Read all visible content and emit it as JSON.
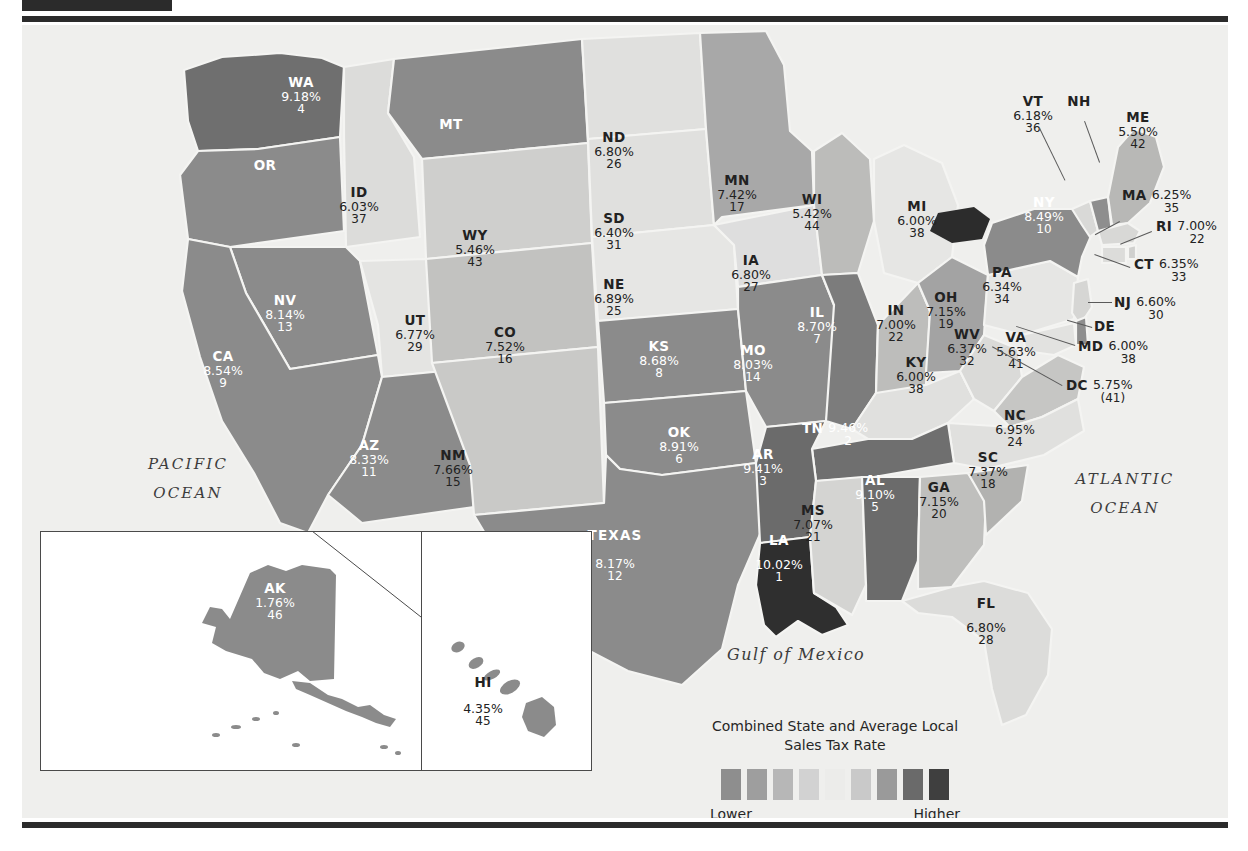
{
  "figure": {
    "legend_title_line1": "Combined State and Average Local",
    "legend_title_line2": "Sales Tax Rate",
    "legend_low_label": "Lower",
    "legend_high_label": "Higher",
    "legend_colors": [
      "#8e8e8e",
      "#9e9e9e",
      "#b7b7b7",
      "#d2d2d2",
      "#ececea",
      "#c9c9c9",
      "#9a9a9a",
      "#6a6a6a",
      "#3f3f3f"
    ],
    "water_labels": {
      "pacific_line1": "PACIFIC",
      "pacific_line2": "OCEAN",
      "atlantic_line1": "ATLANTIC",
      "atlantic_line2": "OCEAN",
      "gulf": "Gulf of Mexico"
    },
    "background_color": "#efefed"
  },
  "chart_data": {
    "type": "map",
    "title": "Combined State and Average Local Sales Tax Rate",
    "value_label": "Combined state and average local sales tax rate (%)",
    "rank_label": "Rank",
    "legend_low": "Lower",
    "legend_high": "Higher",
    "states": [
      {
        "abbr": "WA",
        "rate": "9.18%",
        "rank": "4",
        "value": 9.18,
        "rank_value": 4
      },
      {
        "abbr": "OR",
        "rate": "",
        "rank": "",
        "value": 0.0,
        "rank_value": null
      },
      {
        "abbr": "ID",
        "rate": "6.03%",
        "rank": "37",
        "value": 6.03,
        "rank_value": 37
      },
      {
        "abbr": "MT",
        "rate": "",
        "rank": "",
        "value": 0.0,
        "rank_value": null
      },
      {
        "abbr": "ND",
        "rate": "6.80%",
        "rank": "26",
        "value": 6.8,
        "rank_value": 26
      },
      {
        "abbr": "SD",
        "rate": "6.40%",
        "rank": "31",
        "value": 6.4,
        "rank_value": 31
      },
      {
        "abbr": "WY",
        "rate": "5.46%",
        "rank": "43",
        "value": 5.46,
        "rank_value": 43
      },
      {
        "abbr": "NE",
        "rate": "6.89%",
        "rank": "25",
        "value": 6.89,
        "rank_value": 25
      },
      {
        "abbr": "MN",
        "rate": "7.42%",
        "rank": "17",
        "value": 7.42,
        "rank_value": 17
      },
      {
        "abbr": "WI",
        "rate": "5.42%",
        "rank": "44",
        "value": 5.42,
        "rank_value": 44
      },
      {
        "abbr": "MI",
        "rate": "6.00%",
        "rank": "38",
        "value": 6.0,
        "rank_value": 38
      },
      {
        "abbr": "IA",
        "rate": "6.80%",
        "rank": "27",
        "value": 6.8,
        "rank_value": 27
      },
      {
        "abbr": "IL",
        "rate": "8.70%",
        "rank": "7",
        "value": 8.7,
        "rank_value": 7
      },
      {
        "abbr": "IN",
        "rate": "7.00%",
        "rank": "22",
        "value": 7.0,
        "rank_value": 22
      },
      {
        "abbr": "OH",
        "rate": "7.15%",
        "rank": "19",
        "value": 7.15,
        "rank_value": 19
      },
      {
        "abbr": "KY",
        "rate": "6.00%",
        "rank": "38",
        "value": 6.0,
        "rank_value": 38
      },
      {
        "abbr": "NV",
        "rate": "8.14%",
        "rank": "13",
        "value": 8.14,
        "rank_value": 13
      },
      {
        "abbr": "UT",
        "rate": "6.77%",
        "rank": "29",
        "value": 6.77,
        "rank_value": 29
      },
      {
        "abbr": "CA",
        "rate": "8.54%",
        "rank": "9",
        "value": 8.54,
        "rank_value": 9
      },
      {
        "abbr": "CO",
        "rate": "7.52%",
        "rank": "16",
        "value": 7.52,
        "rank_value": 16
      },
      {
        "abbr": "KS",
        "rate": "8.68%",
        "rank": "8",
        "value": 8.68,
        "rank_value": 8
      },
      {
        "abbr": "MO",
        "rate": "8.03%",
        "rank": "14",
        "value": 8.03,
        "rank_value": 14
      },
      {
        "abbr": "AZ",
        "rate": "8.33%",
        "rank": "11",
        "value": 8.33,
        "rank_value": 11
      },
      {
        "abbr": "NM",
        "rate": "7.66%",
        "rank": "15",
        "value": 7.66,
        "rank_value": 15
      },
      {
        "abbr": "OK",
        "rate": "8.91%",
        "rank": "6",
        "value": 8.91,
        "rank_value": 6
      },
      {
        "abbr": "AR",
        "rate": "9.41%",
        "rank": "3",
        "value": 9.41,
        "rank_value": 3
      },
      {
        "abbr": "TN",
        "rate": "9.46%",
        "rank": "2",
        "value": 9.46,
        "rank_value": 2
      },
      {
        "abbr": "MS",
        "rate": "7.07%",
        "rank": "21",
        "value": 7.07,
        "rank_value": 21
      },
      {
        "abbr": "AL",
        "rate": "9.10%",
        "rank": "5",
        "value": 9.1,
        "rank_value": 5
      },
      {
        "abbr": "GA",
        "rate": "7.15%",
        "rank": "20",
        "value": 7.15,
        "rank_value": 20
      },
      {
        "abbr": "SC",
        "rate": "7.37%",
        "rank": "18",
        "value": 7.37,
        "rank_value": 18
      },
      {
        "abbr": "NC",
        "rate": "6.95%",
        "rank": "24",
        "value": 6.95,
        "rank_value": 24
      },
      {
        "abbr": "WV",
        "rate": "6.37%",
        "rank": "32",
        "value": 6.37,
        "rank_value": 32
      },
      {
        "abbr": "VA",
        "rate": "5.63%",
        "rank": "41",
        "value": 5.63,
        "rank_value": 41
      },
      {
        "abbr": "TEXAS",
        "rate": "8.17%",
        "rank": "12",
        "value": 8.17,
        "rank_value": 12
      },
      {
        "abbr": "LA",
        "rate": "10.02%",
        "rank": "1",
        "value": 10.02,
        "rank_value": 1
      },
      {
        "abbr": "FL",
        "rate": "6.80%",
        "rank": "28",
        "value": 6.8,
        "rank_value": 28
      },
      {
        "abbr": "PA",
        "rate": "6.34%",
        "rank": "34",
        "value": 6.34,
        "rank_value": 34
      },
      {
        "abbr": "NY",
        "rate": "8.49%",
        "rank": "10",
        "value": 8.49,
        "rank_value": 10
      },
      {
        "abbr": "VT",
        "rate": "6.18%",
        "rank": "36",
        "value": 6.18,
        "rank_value": 36
      },
      {
        "abbr": "NH",
        "rate": "",
        "rank": "",
        "value": 0.0,
        "rank_value": null
      },
      {
        "abbr": "ME",
        "rate": "5.50%",
        "rank": "42",
        "value": 5.5,
        "rank_value": 42
      },
      {
        "abbr": "MA",
        "rate": "6.25%",
        "rank": "35",
        "value": 6.25,
        "rank_value": 35
      },
      {
        "abbr": "RI",
        "rate": "7.00%",
        "rank": "22",
        "value": 7.0,
        "rank_value": 22
      },
      {
        "abbr": "CT",
        "rate": "6.35%",
        "rank": "33",
        "value": 6.35,
        "rank_value": 33
      },
      {
        "abbr": "NJ",
        "rate": "6.60%",
        "rank": "30",
        "value": 6.6,
        "rank_value": 30
      },
      {
        "abbr": "DE",
        "rate": "",
        "rank": "",
        "value": 0.0,
        "rank_value": null
      },
      {
        "abbr": "MD",
        "rate": "6.00%",
        "rank": "38",
        "value": 6.0,
        "rank_value": 38
      },
      {
        "abbr": "DC",
        "rate": "5.75%",
        "rank": "(41)",
        "value": 5.75,
        "rank_value": 41
      },
      {
        "abbr": "AK",
        "rate": "1.76%",
        "rank": "46",
        "value": 1.76,
        "rank_value": 46
      },
      {
        "abbr": "HI",
        "rate": "4.35%",
        "rank": "45",
        "value": 4.35,
        "rank_value": 45
      }
    ]
  },
  "labels": {
    "WA": {
      "abbr": "WA",
      "rate": "9.18%",
      "rank": "4"
    },
    "OR": {
      "abbr": "OR",
      "rate": "",
      "rank": ""
    },
    "ID": {
      "abbr": "ID",
      "rate": "6.03%",
      "rank": "37"
    },
    "MT": {
      "abbr": "MT",
      "rate": "",
      "rank": ""
    },
    "ND": {
      "abbr": "ND",
      "rate": "6.80%",
      "rank": "26"
    },
    "SD": {
      "abbr": "SD",
      "rate": "6.40%",
      "rank": "31"
    },
    "WY": {
      "abbr": "WY",
      "rate": "5.46%",
      "rank": "43"
    },
    "NE": {
      "abbr": "NE",
      "rate": "6.89%",
      "rank": "25"
    },
    "MN": {
      "abbr": "MN",
      "rate": "7.42%",
      "rank": "17"
    },
    "WI": {
      "abbr": "WI",
      "rate": "5.42%",
      "rank": "44"
    },
    "MI": {
      "abbr": "MI",
      "rate": "6.00%",
      "rank": "38"
    },
    "IA": {
      "abbr": "IA",
      "rate": "6.80%",
      "rank": "27"
    },
    "IL": {
      "abbr": "IL",
      "rate": "8.70%",
      "rank": "7"
    },
    "IN": {
      "abbr": "IN",
      "rate": "7.00%",
      "rank": "22"
    },
    "OH": {
      "abbr": "OH",
      "rate": "7.15%",
      "rank": "19"
    },
    "KY": {
      "abbr": "KY",
      "rate": "6.00%",
      "rank": "38"
    },
    "NV": {
      "abbr": "NV",
      "rate": "8.14%",
      "rank": "13"
    },
    "UT": {
      "abbr": "UT",
      "rate": "6.77%",
      "rank": "29"
    },
    "CA": {
      "abbr": "CA",
      "rate": "8.54%",
      "rank": "9"
    },
    "CO": {
      "abbr": "CO",
      "rate": "7.52%",
      "rank": "16"
    },
    "KS": {
      "abbr": "KS",
      "rate": "8.68%",
      "rank": "8"
    },
    "MO": {
      "abbr": "MO",
      "rate": "8.03%",
      "rank": "14"
    },
    "AZ": {
      "abbr": "AZ",
      "rate": "8.33%",
      "rank": "11"
    },
    "NM": {
      "abbr": "NM",
      "rate": "7.66%",
      "rank": "15"
    },
    "OK": {
      "abbr": "OK",
      "rate": "8.91%",
      "rank": "6"
    },
    "AR": {
      "abbr": "AR",
      "rate": "9.41%",
      "rank": "3"
    },
    "TN": {
      "abbr": "TN",
      "rate": "9.46%",
      "rank": "2"
    },
    "MS": {
      "abbr": "MS",
      "rate": "7.07%",
      "rank": "21"
    },
    "AL": {
      "abbr": "AL",
      "rate": "9.10%",
      "rank": "5"
    },
    "GA": {
      "abbr": "GA",
      "rate": "7.15%",
      "rank": "20"
    },
    "SC": {
      "abbr": "SC",
      "rate": "7.37%",
      "rank": "18"
    },
    "NC": {
      "abbr": "NC",
      "rate": "6.95%",
      "rank": "24"
    },
    "WV": {
      "abbr": "WV",
      "rate": "6.37%",
      "rank": "32"
    },
    "VA": {
      "abbr": "VA",
      "rate": "5.63%",
      "rank": "41"
    },
    "TX": {
      "abbr": "TEXAS",
      "rate": "8.17%",
      "rank": "12"
    },
    "LA": {
      "abbr": "LA",
      "rate": "10.02%",
      "rank": "1"
    },
    "FL": {
      "abbr": "FL",
      "rate": "6.80%",
      "rank": "28"
    },
    "PA": {
      "abbr": "PA",
      "rate": "6.34%",
      "rank": "34"
    },
    "NY": {
      "abbr": "NY",
      "rate": "8.49%",
      "rank": "10"
    },
    "VT": {
      "abbr": "VT",
      "rate": "6.18%",
      "rank": "36"
    },
    "NH": {
      "abbr": "NH",
      "rate": "",
      "rank": ""
    },
    "ME": {
      "abbr": "ME",
      "rate": "5.50%",
      "rank": "42"
    },
    "MA": {
      "abbr": "MA",
      "rate": "6.25%",
      "rank": "35"
    },
    "RI": {
      "abbr": "RI",
      "rate": "7.00%",
      "rank": "22"
    },
    "CT": {
      "abbr": "CT",
      "rate": "6.35%",
      "rank": "33"
    },
    "NJ": {
      "abbr": "NJ",
      "rate": "6.60%",
      "rank": "30"
    },
    "DE": {
      "abbr": "DE",
      "rate": "",
      "rank": ""
    },
    "MD": {
      "abbr": "MD",
      "rate": "6.00%",
      "rank": "38"
    },
    "DC": {
      "abbr": "DC",
      "rate": "5.75%",
      "rank": "(41)"
    },
    "AK": {
      "abbr": "AK",
      "rate": "1.76%",
      "rank": "46"
    },
    "HI": {
      "abbr": "HI",
      "rate": "4.35%",
      "rank": "45"
    }
  }
}
